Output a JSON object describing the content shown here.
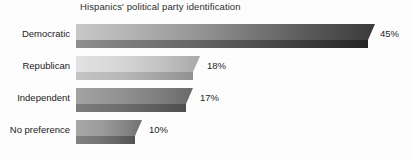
{
  "chart_data": {
    "type": "bar",
    "orientation": "horizontal",
    "title": "Hispanics' political party identification",
    "xlabel": "",
    "ylabel": "",
    "categories": [
      "Democratic",
      "Republican",
      "Independent",
      "No preference"
    ],
    "values": [
      45,
      18,
      17,
      10
    ],
    "value_labels": [
      "45%",
      "18%",
      "17%",
      "10%"
    ],
    "unit": "%",
    "xlim": [
      0,
      50
    ],
    "grid": false,
    "legend": false,
    "style": "3d-gradient-bars",
    "colors": {
      "bar_light_start": "#c9c9c9",
      "bar_dark_end": "#3a3a3a",
      "bar_side_start": "#9a9a9a",
      "bar_side_end": "#262626",
      "republican_light_start": "#dedede",
      "republican_light_end": "#a6a6a6",
      "text": "#222222",
      "background": "#ffffff"
    }
  },
  "bars": [
    {
      "category": "Democratic",
      "value": 45,
      "value_label": "45%",
      "pixel_width": 299,
      "top_gradient": "linear-gradient(90deg,#c9c9c9 0%,#b4b4b4 18%,#8f8f8f 45%,#5d5d5d 75%,#3a3a3a 100%)",
      "side_gradient": "linear-gradient(90deg,#8f8f8f 0%,#7a7a7a 20%,#5c5c5c 50%,#3a3a3a 80%,#242424 100%)",
      "label_left": 380
    },
    {
      "category": "Republican",
      "value": 18,
      "value_label": "18%",
      "pixel_width": 124,
      "top_gradient": "linear-gradient(90deg,#e2e2e2 0%,#d7d7d7 35%,#c2c2c2 70%,#a8a8a8 100%)",
      "side_gradient": "linear-gradient(90deg,#c4c4c4 0%,#b8b8b8 40%,#a2a2a2 75%,#909090 100%)",
      "label_left": 207
    },
    {
      "category": "Independent",
      "value": 17,
      "value_label": "17%",
      "pixel_width": 117,
      "top_gradient": "linear-gradient(90deg,#a3a3a3 0%,#949494 35%,#7f7f7f 70%,#6a6a6a 100%)",
      "side_gradient": "linear-gradient(90deg,#7d7d7d 0%,#6e6e6e 40%,#5c5c5c 75%,#4e4e4e 100%)",
      "label_left": 200
    },
    {
      "category": "No preference",
      "value": 10,
      "value_label": "10%",
      "pixel_width": 66,
      "top_gradient": "linear-gradient(90deg,#a8a8a8 0%,#9b9b9b 40%,#858585 75%,#707070 100%)",
      "side_gradient": "linear-gradient(90deg,#828282 0%,#757575 40%,#626262 75%,#525252 100%)",
      "label_left": 149
    }
  ],
  "layout": {
    "bar_rows_top": [
      24,
      56,
      88,
      120
    ],
    "bar_origin_x": 76,
    "label_column_width": 70
  }
}
